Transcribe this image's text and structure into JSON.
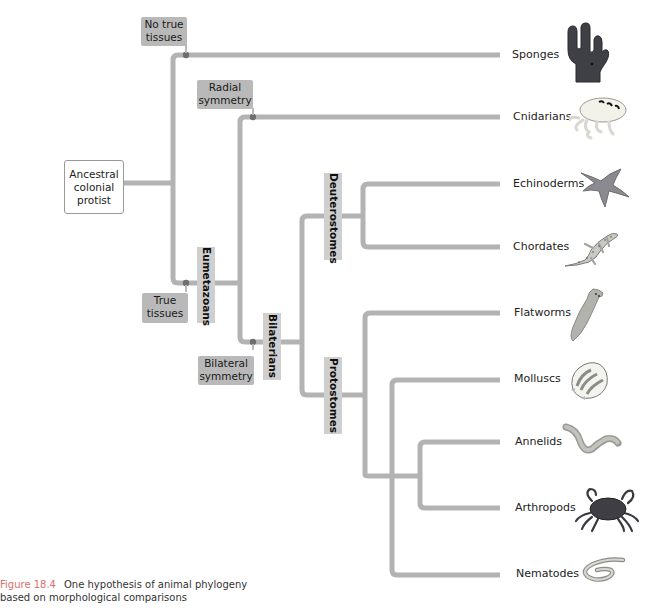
{
  "root": {
    "label": "Ancestral colonial protist"
  },
  "characters": {
    "no_true_tissues": "No true tissues",
    "true_tissues": "True tissues",
    "radial_symmetry": "Radial symmetry",
    "bilateral_symmetry": "Bilateral symmetry"
  },
  "clades": {
    "eumetazoans": "Eumetazoans",
    "bilaterians": "Bilaterians",
    "deuterostomes": "Deuterostomes",
    "protostomes": "Protostomes"
  },
  "taxa": [
    {
      "name": "Sponges",
      "icon": "sponge-icon"
    },
    {
      "name": "Cnidarians",
      "icon": "jellyfish-icon"
    },
    {
      "name": "Echinoderms",
      "icon": "starfish-icon"
    },
    {
      "name": "Chordates",
      "icon": "lizard-icon"
    },
    {
      "name": "Flatworms",
      "icon": "flatworm-icon"
    },
    {
      "name": "Molluscs",
      "icon": "shell-icon"
    },
    {
      "name": "Annelids",
      "icon": "earthworm-icon"
    },
    {
      "name": "Arthropods",
      "icon": "crab-icon"
    },
    {
      "name": "Nematodes",
      "icon": "roundworm-icon"
    }
  ],
  "caption": {
    "figure_number": "Figure 18.4",
    "text_line1": "One hypothesis of animal phylogeny",
    "text_line2": "based on morphological comparisons"
  },
  "colors": {
    "branch": "#b3b3b3",
    "node": "#6e6e6e",
    "figure_label": "#d97070"
  }
}
